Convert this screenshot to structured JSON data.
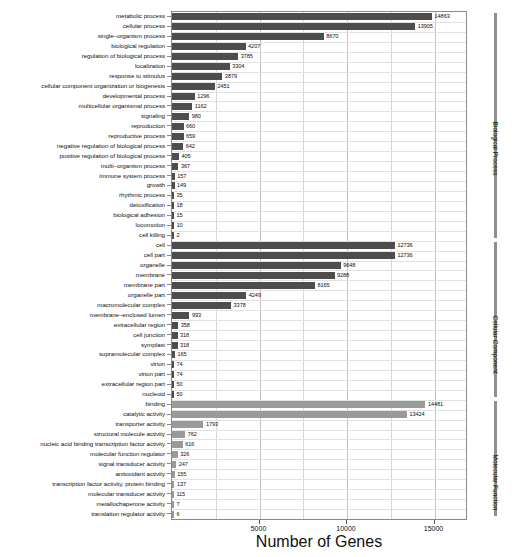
{
  "chart_data": {
    "type": "bar",
    "orientation": "horizontal",
    "title": "",
    "xlabel": "Number of Genes",
    "ylabel": "",
    "xlim": [
      0,
      16800
    ],
    "xticks": [
      5000,
      10000,
      15000
    ],
    "xticklabels": [
      "5000",
      "10000",
      "15000"
    ],
    "grid": "vertical and horizontal light gridlines",
    "legend": "none",
    "groups": [
      {
        "name": "Biological Process",
        "color": "#4d4d4d"
      },
      {
        "name": "Cellular Component",
        "color": "#4d4d4d"
      },
      {
        "name": "Molecular Function",
        "color": "#9a9a9a"
      }
    ],
    "categories": [
      "metabolic process",
      "cellular process",
      "single–organism process",
      "biological regulation",
      "regulation of biological process",
      "localization",
      "response to stimulus",
      "cellular component organization or biogenesis",
      "developmental process",
      "multicellular organismal process",
      "signaling",
      "reproduction",
      "reproductive process",
      "negative regulation of biological process",
      "positive regulation of biological process",
      "multi–organism process",
      "immune system process",
      "growth",
      "rhythmic process",
      "detoxification",
      "biological adhesion",
      "locomotion",
      "cell killing",
      "cell",
      "cell part",
      "organelle",
      "membrane",
      "membrane part",
      "organelle part",
      "macromolecular complex",
      "membrane–enclosed lumen",
      "extracellular region",
      "cell junction",
      "symplast",
      "supramolecular complex",
      "virion",
      "virion part",
      "extracellular region part",
      "nucleoid",
      "binding",
      "catalytic activity",
      "transporter activity",
      "structural molecule activity",
      "nucleic acid binding transcription factor activity",
      "molecular function regulator",
      "signal transducer activity",
      "antioxidant activity",
      "transcription factor activity, protein binding",
      "molecular transducer activity",
      "metallochaperone activity",
      "translation regulator activity"
    ],
    "values": [
      14863,
      13905,
      8670,
      4207,
      3785,
      3304,
      2879,
      2451,
      1296,
      1162,
      980,
      660,
      659,
      642,
      405,
      367,
      157,
      149,
      35,
      18,
      15,
      10,
      2,
      12736,
      12736,
      9648,
      9288,
      8165,
      4249,
      3378,
      993,
      358,
      318,
      318,
      165,
      74,
      74,
      50,
      50,
      14481,
      13424,
      1793,
      762,
      616,
      326,
      247,
      155,
      137,
      115,
      7,
      6
    ],
    "group_of_category": [
      "bp",
      "bp",
      "bp",
      "bp",
      "bp",
      "bp",
      "bp",
      "bp",
      "bp",
      "bp",
      "bp",
      "bp",
      "bp",
      "bp",
      "bp",
      "bp",
      "bp",
      "bp",
      "bp",
      "bp",
      "bp",
      "bp",
      "bp",
      "cc",
      "cc",
      "cc",
      "cc",
      "cc",
      "cc",
      "cc",
      "cc",
      "cc",
      "cc",
      "cc",
      "cc",
      "cc",
      "cc",
      "cc",
      "cc",
      "mf",
      "mf",
      "mf",
      "mf",
      "mf",
      "mf",
      "mf",
      "mf",
      "mf",
      "mf",
      "mf",
      "mf"
    ],
    "value_labels": [
      "14863",
      "13905",
      "8670",
      "4207",
      "3785",
      "3304",
      "2879",
      "2451",
      "1296",
      "1162",
      "980",
      "660",
      "659",
      "642",
      "405",
      "367",
      "157",
      "149",
      "35",
      "18",
      "15",
      "10",
      "2",
      "12736",
      "12736",
      "9648",
      "9288",
      "8165",
      "4249",
      "3378",
      "993",
      "358",
      "318",
      "318",
      "165",
      "74",
      "74",
      "50",
      "50",
      "14481",
      "13424",
      "1793",
      "762",
      "616",
      "326",
      "247",
      "155",
      "137",
      "115",
      "7",
      "6"
    ]
  },
  "axis": {
    "x_title": "Number of Genes",
    "ticks": [
      "5000",
      "10000",
      "15000"
    ]
  },
  "brackets": [
    {
      "label": "Biological Process",
      "key": "bp"
    },
    {
      "label": "Cellular Component",
      "key": "cc"
    },
    {
      "label": "Molecular Function",
      "key": "mf"
    }
  ]
}
